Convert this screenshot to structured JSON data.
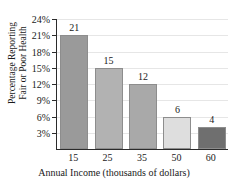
{
  "chart_data": {
    "type": "bar",
    "title": "",
    "xlabel": "Annual Income (thousands of dollars)",
    "ylabel": "Percentage Reporting Fair or Poor Health",
    "ylabel_line1": "Percentage Reporting",
    "ylabel_line2": "Fair or Poor Health",
    "categories": [
      "15",
      "25",
      "35",
      "50",
      "60"
    ],
    "values": [
      21,
      15,
      12,
      6,
      4
    ],
    "value_labels": [
      "21",
      "15",
      "12",
      "6",
      "4"
    ],
    "bar_colors": [
      "#9a9a9a",
      "#b2b2b2",
      "#a9a9a9",
      "#dedede",
      "#6f6f6f"
    ],
    "bar_border_color": "#8d8d8d",
    "ylim": [
      0,
      24
    ],
    "ytick_values": [
      3,
      6,
      9,
      12,
      15,
      18,
      21,
      24
    ],
    "ytick_labels": [
      "3%",
      "6%",
      "9%",
      "12%",
      "15%",
      "18%",
      "21%",
      "24%"
    ],
    "grid": true,
    "grid_color": "#e6e6e6",
    "axis_color": "#2b2b2b",
    "legend": "none",
    "background": "#ffffff"
  }
}
